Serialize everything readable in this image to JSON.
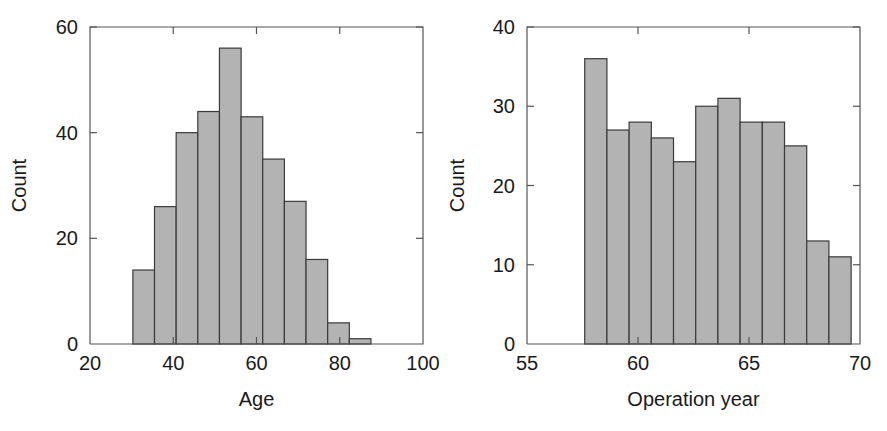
{
  "figure": {
    "background_color": "#ffffff",
    "bar_fill_color": "#b3b3b3",
    "bar_edge_color": "#3a3a3a",
    "axis_color": "#555555",
    "text_color": "#1a1a1a"
  },
  "panels": [
    {
      "id": "age-histogram",
      "ylabel": "Count",
      "xlabel": "Age",
      "y_ticks": [
        "0",
        "20",
        "40",
        "60"
      ],
      "x_ticks": [
        "20",
        "40",
        "60",
        "80",
        "100"
      ]
    },
    {
      "id": "operation-year-histogram",
      "ylabel": "Count",
      "xlabel": "Operation year",
      "y_ticks": [
        "0",
        "10",
        "20",
        "30",
        "40"
      ],
      "x_ticks": [
        "55",
        "60",
        "65",
        "70"
      ]
    }
  ],
  "chart_data": [
    {
      "type": "bar",
      "id": "age-histogram",
      "title": "",
      "xlabel": "Age",
      "ylabel": "Count",
      "xlim": [
        20,
        100
      ],
      "ylim": [
        0,
        60
      ],
      "xticks": [
        20,
        40,
        60,
        80,
        100
      ],
      "yticks": [
        0,
        20,
        40,
        60
      ],
      "grid": false,
      "legend": null,
      "bin_width": 5.2,
      "bin_edges": [
        30.3,
        35.5,
        40.7,
        45.9,
        51.1,
        56.3,
        61.5,
        66.7,
        71.9,
        77.1,
        82.3,
        87.5
      ],
      "categories": [
        "30-36",
        "36-41",
        "41-46",
        "46-51",
        "51-56",
        "56-62",
        "62-67",
        "67-72",
        "72-77",
        "77-82",
        "82-88"
      ],
      "values": [
        14,
        26,
        40,
        44,
        56,
        43,
        35,
        27,
        16,
        4,
        1
      ]
    },
    {
      "type": "bar",
      "id": "operation-year-histogram",
      "title": "",
      "xlabel": "Operation year",
      "ylabel": "Count",
      "xlim": [
        55,
        70
      ],
      "ylim": [
        0,
        40
      ],
      "xticks": [
        55,
        60,
        65,
        70
      ],
      "yticks": [
        0,
        10,
        20,
        30,
        40
      ],
      "grid": false,
      "legend": null,
      "bin_width": 1.0,
      "bin_edges": [
        57.6,
        58.6,
        59.6,
        60.6,
        61.6,
        62.6,
        63.6,
        64.6,
        65.6,
        66.6,
        67.6,
        68.6,
        69.6
      ],
      "categories": [
        "58",
        "59",
        "60",
        "61",
        "62",
        "63",
        "64",
        "65",
        "66",
        "67",
        "68",
        "69"
      ],
      "values": [
        36,
        27,
        28,
        26,
        23,
        30,
        31,
        28,
        28,
        25,
        13,
        11
      ]
    }
  ]
}
